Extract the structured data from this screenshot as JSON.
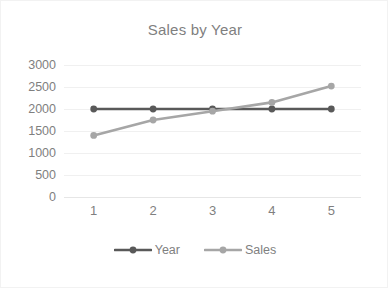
{
  "chart_data": {
    "type": "line",
    "title": "Sales by Year",
    "xlabel": "",
    "ylabel": "",
    "categories": [
      "1",
      "2",
      "3",
      "4",
      "5"
    ],
    "x": [
      1,
      2,
      3,
      4,
      5
    ],
    "ylim": [
      0,
      3000
    ],
    "y_ticks": [
      "0",
      "500",
      "1000",
      "1500",
      "2000",
      "2500",
      "3000"
    ],
    "y_tick_values": [
      0,
      500,
      1000,
      1500,
      2000,
      2500,
      3000
    ],
    "grid": true,
    "legend_position": "bottom",
    "series": [
      {
        "name": "Year",
        "color": "#595959",
        "values": [
          2000,
          2000,
          2000,
          2000,
          2000
        ]
      },
      {
        "name": "Sales",
        "color": "#a6a6a6",
        "values": [
          1400,
          1750,
          1950,
          2150,
          2520
        ]
      }
    ]
  },
  "colors": {
    "title": "#7f7f7f",
    "tick_label": "#7f7f7f",
    "gridline": "#f0f0f0",
    "border": "#f2f2f2",
    "background": "#ffffff"
  }
}
